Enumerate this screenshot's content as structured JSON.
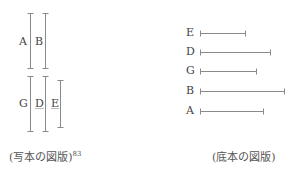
{
  "left_figure": {
    "caption": "(写本の図版)",
    "caption_note": "83",
    "top_group": {
      "labels": [
        {
          "text": "A",
          "x": 19,
          "y": 36
        },
        {
          "text": "B",
          "x": 35,
          "y": 36
        }
      ],
      "bars": [
        {
          "x": 30,
          "y1": 13,
          "y2": 68
        },
        {
          "x": 45,
          "y1": 13,
          "y2": 68
        }
      ]
    },
    "bottom_group": {
      "labels": [
        {
          "text": "G",
          "x": 19,
          "y": 98
        },
        {
          "text": "D",
          "x": 35,
          "y": 98,
          "underline": true
        },
        {
          "text": "E",
          "x": 51,
          "y": 98,
          "underline": true
        }
      ],
      "bars": [
        {
          "x": 30,
          "y1": 76,
          "y2": 131
        },
        {
          "x": 45,
          "y1": 76,
          "y2": 131
        },
        {
          "x": 60,
          "y1": 80,
          "y2": 127
        }
      ]
    }
  },
  "right_figure": {
    "caption": "(底本の図版)",
    "rows": [
      {
        "label": "E",
        "y": 33,
        "x_end": 245
      },
      {
        "label": "D",
        "y": 52,
        "x_end": 270
      },
      {
        "label": "G",
        "y": 71,
        "x_end": 256
      },
      {
        "label": "B",
        "y": 91,
        "x_end": 284
      },
      {
        "label": "A",
        "y": 111,
        "x_end": 263
      }
    ],
    "x_start": 200
  },
  "colors": {
    "line": "#8a8a8a",
    "text": "#444444"
  }
}
